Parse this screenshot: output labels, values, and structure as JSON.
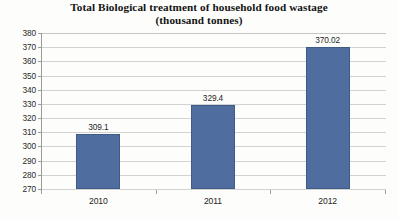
{
  "chart_data": {
    "type": "bar",
    "title": "Total Biological treatment of household food wastage",
    "subtitle": "(thousand tonnes)",
    "xlabel": "",
    "ylabel": "",
    "categories": [
      "2010",
      "2011",
      "2012"
    ],
    "values": [
      309.1,
      329.4,
      370.02
    ],
    "value_labels": [
      "309.1",
      "329.4",
      "370.02"
    ],
    "ylim": [
      270,
      380
    ],
    "ytick_step": 10,
    "ytick_labels": [
      "380",
      "370",
      "360",
      "350",
      "340",
      "330",
      "320",
      "310",
      "300",
      "290",
      "280",
      "270"
    ],
    "grid": true,
    "legend": false,
    "series": [
      {
        "name": "Biological treatment of household food wastage",
        "values": [
          309.1,
          329.4,
          370.02
        ]
      }
    ],
    "colors": {
      "bar_fill": "#4f6d9e",
      "bar_border": "#3f5a87",
      "gridline": "#d2d2d2",
      "axis_line": "#9a9a9a",
      "background": "#fdfdfb",
      "title_text": "#131313",
      "tick_text": "#2b2b2b"
    }
  }
}
